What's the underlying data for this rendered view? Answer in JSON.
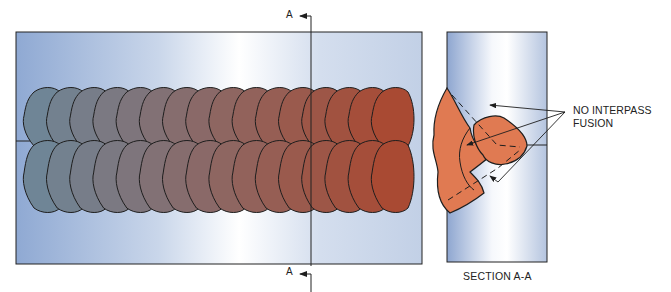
{
  "diagram": {
    "type": "weld-defect-illustration",
    "top_section_marker": "A",
    "bottom_section_marker": "A",
    "callout_line1": "NO INTERPASS",
    "callout_line2": "FUSION",
    "section_title": "SECTION A-A",
    "bead_columns": 16,
    "bead_rows": 2,
    "colors": {
      "plate_light": "#ffffff",
      "plate_dark": "#8fa9d3",
      "bead_start": "#6f8596",
      "bead_end": "#a94a33",
      "section_bead": "#e07a52",
      "outline": "#1e1e1e"
    }
  }
}
